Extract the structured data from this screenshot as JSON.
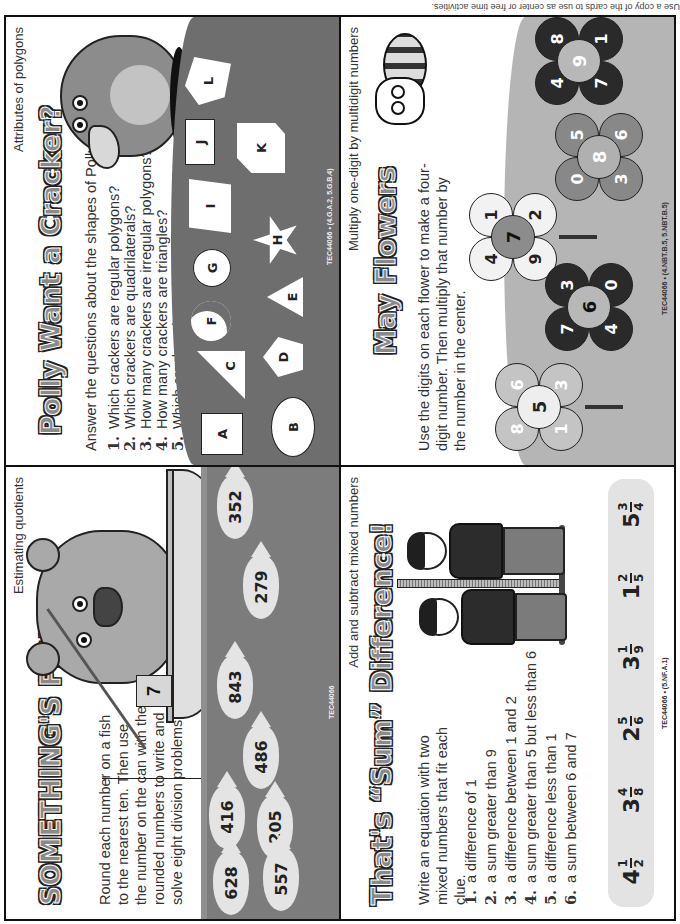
{
  "page_caption": "Use a copy of the cards to use as center or free time activities.",
  "cards": {
    "fishy": {
      "skill": "Estimating quotients",
      "title": "SOMETHING'S FISHY",
      "instructions": "Round each number on a fish to the nearest ten. Then use the number on the can with the rounded numbers to write and solve eight division problems.",
      "can_number": "7",
      "fish": [
        "352",
        "279",
        "843",
        "486",
        "205",
        "416",
        "557",
        "628"
      ],
      "code": "TEC44066",
      "icons": [
        "bear-icon",
        "boat-icon",
        "fishing-rod-icon",
        "worm-can-icon",
        "fish-icon"
      ]
    },
    "polly": {
      "skill": "Attributes of polygons",
      "title": "Polly Want a Cracker?",
      "instructions": "Answer the questions about the shapes of Polly's crackers.",
      "questions": [
        {
          "n": "1.",
          "text": "Which crackers are regular polygons?"
        },
        {
          "n": "2.",
          "text": "Which crackers are quadrilaterals?"
        },
        {
          "n": "3.",
          "text": "How many crackers are irregular polygons?"
        },
        {
          "n": "4.",
          "text": "How many crackers are triangles?"
        },
        {
          "n": "5.",
          "text": "Which crackers have right angles?"
        }
      ],
      "crackers": [
        {
          "label": "A",
          "shape": "square"
        },
        {
          "label": "B",
          "shape": "oval"
        },
        {
          "label": "C",
          "shape": "right-triangle"
        },
        {
          "label": "D",
          "shape": "pentagon"
        },
        {
          "label": "E",
          "shape": "triangle"
        },
        {
          "label": "F",
          "shape": "crescent"
        },
        {
          "label": "G",
          "shape": "circle"
        },
        {
          "label": "H",
          "shape": "star"
        },
        {
          "label": "I",
          "shape": "trapezoid"
        },
        {
          "label": "J",
          "shape": "rectangle"
        },
        {
          "label": "K",
          "shape": "irregular-hexagon"
        },
        {
          "label": "L",
          "shape": "irregular-pentagon"
        }
      ],
      "code": "TEC44066 • (4.G.A.2, 5.G.B.4)"
    },
    "sum_difference": {
      "skill": "Add and subtract mixed numbers",
      "title": "That's “Sum” Difference!",
      "instructions": "Write an equation with two mixed numbers that fit each clue.",
      "clues": [
        {
          "n": "1.",
          "text": "a difference of 1"
        },
        {
          "n": "2.",
          "text": "a sum greater than 9"
        },
        {
          "n": "3.",
          "text": "a difference between 1 and 2"
        },
        {
          "n": "4.",
          "text": "a sum greater than 5 but less than 6"
        },
        {
          "n": "5.",
          "text": "a difference less than 1"
        },
        {
          "n": "6.",
          "text": "a sum between 6 and 7"
        }
      ],
      "mixed_numbers": [
        {
          "whole": "4",
          "num": "1",
          "den": "2"
        },
        {
          "whole": "3",
          "num": "4",
          "den": "8"
        },
        {
          "whole": "2",
          "num": "5",
          "den": "6"
        },
        {
          "whole": "3",
          "num": "1",
          "den": "9"
        },
        {
          "whole": "1",
          "num": "2",
          "den": "5"
        },
        {
          "whole": "5",
          "num": "3",
          "den": "4"
        }
      ],
      "code": "TEC44066 • (5.NF.A.1)"
    },
    "may_flowers": {
      "skill": "Multiply one-digit by multidigit numbers",
      "title": "May Flowers",
      "instructions": "Use the digits on each flower to make a four-digit number. Then multiply that number by the number in the center.",
      "flowers": [
        {
          "center": "5",
          "petals": [
            "8",
            "6",
            "3",
            "1"
          ],
          "tone": "light-gray"
        },
        {
          "center": "7",
          "petals": [
            "4",
            "1",
            "2",
            "9"
          ],
          "tone": "white"
        },
        {
          "center": "6",
          "petals": [
            "7",
            "3",
            "0",
            "4"
          ],
          "tone": "black"
        },
        {
          "center": "8",
          "petals": [
            "0",
            "5",
            "6",
            "3"
          ],
          "tone": "gray"
        },
        {
          "center": "9",
          "petals": [
            "4",
            "8",
            "1",
            "7"
          ],
          "tone": "black"
        }
      ],
      "code": "TEC44066 • (4.NBT.B.5, 5.NBT.B.5)"
    }
  },
  "colors": {
    "border": "#111111",
    "text": "#333333",
    "water": "#7c7c7c",
    "ground": "#6e6e6e",
    "meadow": "#b5b5b5",
    "fish": "#e4e4e4",
    "strip": "#e3e3e3"
  }
}
